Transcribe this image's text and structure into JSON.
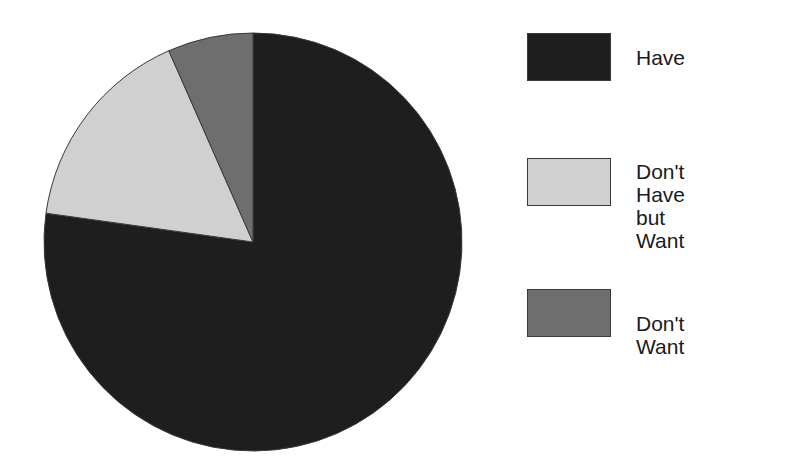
{
  "chart_data": {
    "type": "pie",
    "title": "",
    "start_angle_deg": 0,
    "direction": "clockwise",
    "slices": [
      {
        "label": "Have",
        "value": 77.2,
        "color": "#1e1e1e"
      },
      {
        "label": "Don't Have but Want",
        "value": 16.2,
        "color": "#d0d0d0"
      },
      {
        "label": "Don't Want",
        "value": 6.6,
        "color": "#6e6e6e"
      }
    ],
    "categories": [
      "Have",
      "Don't Have but Want",
      "Don't Want"
    ],
    "values": [
      77.2,
      16.2,
      6.6
    ],
    "legend_position": "right",
    "outline_color": "#3a3a3a"
  },
  "legend": {
    "items": [
      {
        "label": "Have",
        "color": "#1e1e1e"
      },
      {
        "label": "Don't Have\nbut Want",
        "color": "#d0d0d0"
      },
      {
        "label": "Don't Want",
        "color": "#6e6e6e"
      }
    ]
  }
}
